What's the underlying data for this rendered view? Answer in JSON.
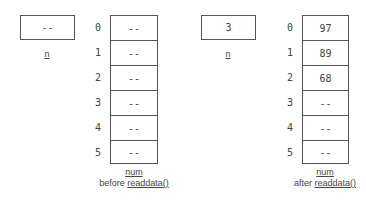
{
  "before": {
    "n": {
      "value": "--",
      "label": "n"
    },
    "num": {
      "label": "num",
      "caption_prefix": "before ",
      "caption_func": "readdata()",
      "indices": [
        "0",
        "1",
        "2",
        "3",
        "4",
        "5"
      ],
      "values": [
        "--",
        "--",
        "--",
        "--",
        "--",
        "--"
      ]
    }
  },
  "after": {
    "n": {
      "value": "3",
      "label": "n"
    },
    "num": {
      "label": "num",
      "caption_prefix": "after ",
      "caption_func": "readdata()",
      "indices": [
        "0",
        "1",
        "2",
        "3",
        "4",
        "5"
      ],
      "values": [
        "97",
        "89",
        "68",
        "--",
        "--",
        "--"
      ]
    }
  }
}
